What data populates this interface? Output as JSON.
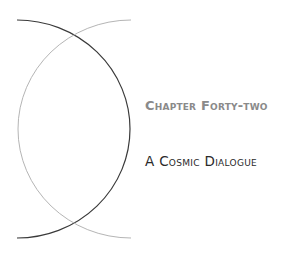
{
  "chapter": {
    "number_label": "Chapter Forty-two",
    "title": "A Cosmic Dialogue"
  },
  "decoration": {
    "dark_arc_color": "#3a3a3a",
    "light_arc_color": "#b5b5b5"
  }
}
